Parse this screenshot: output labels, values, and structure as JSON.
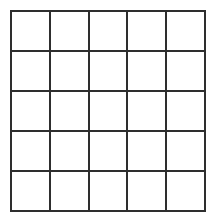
{
  "figure": {
    "name": "blank-grid",
    "type": "grid",
    "columns": 5,
    "rows": 5,
    "cell_count": 25,
    "cells_empty": true,
    "colors": {
      "line": "#2e2e2e",
      "cell_fill": "#ffffff",
      "background": "#ffffff"
    },
    "geometry": {
      "left": 10,
      "top": 10,
      "width": 184,
      "height": 190,
      "line_width": 2,
      "column_edges": [
        10,
        47,
        85,
        122,
        158,
        194
      ],
      "row_edges": [
        10,
        48,
        87,
        125,
        163,
        200
      ],
      "cell_width": 36.8,
      "cell_height": 38
    },
    "grid_cells": [
      [
        "",
        "",
        "",
        "",
        ""
      ],
      [
        "",
        "",
        "",
        "",
        ""
      ],
      [
        "",
        "",
        "",
        "",
        ""
      ],
      [
        "",
        "",
        "",
        "",
        ""
      ],
      [
        "",
        "",
        "",
        "",
        ""
      ]
    ]
  }
}
